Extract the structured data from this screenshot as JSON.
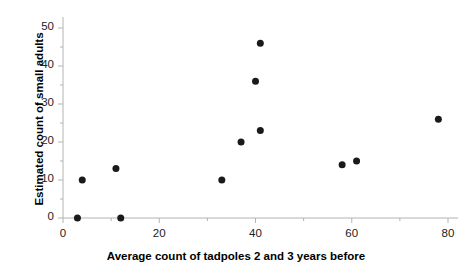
{
  "chart_data": {
    "type": "scatter",
    "title": "",
    "xlabel": "Average count of tadpoles 2 and 3 years before",
    "ylabel": "Estimated count of small adults",
    "xlim": [
      0,
      80
    ],
    "ylim": [
      0,
      50
    ],
    "xticks": [
      0,
      20,
      40,
      60,
      80
    ],
    "yticks": [
      0,
      10,
      20,
      30,
      40,
      50
    ],
    "xtick_labels": [
      "0",
      "20",
      "40",
      "60",
      "80"
    ],
    "ytick_labels": [
      "0",
      "10",
      "20",
      "30",
      "40",
      "50"
    ],
    "x_minor_ticks": [
      10,
      30,
      50,
      70
    ],
    "y_minor_ticks": [
      5,
      15,
      25,
      35,
      45
    ],
    "grid": false,
    "legend": "none",
    "marker": {
      "shape": "circle",
      "color": "#1a1a1a",
      "size": 7
    },
    "axis_color": "#b3b3b3",
    "points": [
      {
        "x": 3,
        "y": 0
      },
      {
        "x": 4,
        "y": 10
      },
      {
        "x": 11,
        "y": 13
      },
      {
        "x": 12,
        "y": 0
      },
      {
        "x": 33,
        "y": 10
      },
      {
        "x": 37,
        "y": 20
      },
      {
        "x": 40,
        "y": 36
      },
      {
        "x": 41,
        "y": 46
      },
      {
        "x": 41,
        "y": 23
      },
      {
        "x": 58,
        "y": 14
      },
      {
        "x": 61,
        "y": 15
      },
      {
        "x": 78,
        "y": 26
      }
    ]
  }
}
